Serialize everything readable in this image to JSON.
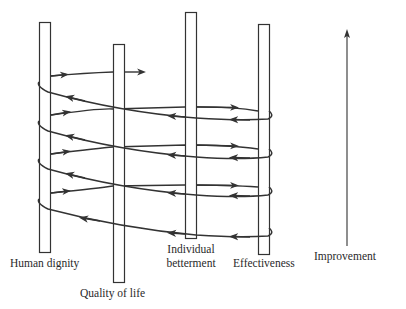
{
  "diagram": {
    "type": "spiral-pillars",
    "pillars": [
      {
        "id": "human-dignity",
        "label": "Human dignity"
      },
      {
        "id": "quality-of-life",
        "label": "Quality of life"
      },
      {
        "id": "individual-betterment",
        "label_line1": "Individual",
        "label_line2": "betterment"
      },
      {
        "id": "effectiveness",
        "label": "Effectiveness"
      }
    ],
    "axis": {
      "label": "Improvement",
      "direction": "up"
    },
    "colors": {
      "stroke": "#333333",
      "text": "#2a2a2a",
      "background": "#ffffff"
    }
  }
}
